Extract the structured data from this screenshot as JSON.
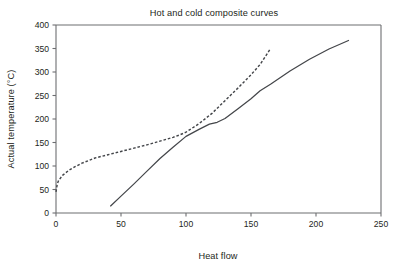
{
  "chart_data": {
    "type": "line",
    "title": "Hot and cold composite curves",
    "xlabel": "Heat flow",
    "ylabel": "Actual temperature (°C)",
    "xlim": [
      0,
      250
    ],
    "ylim": [
      0,
      400
    ],
    "xticks": [
      0,
      50,
      100,
      150,
      200,
      250
    ],
    "yticks": [
      0,
      50,
      100,
      150,
      200,
      250,
      300,
      350,
      400
    ],
    "xtick_labels": [
      "0",
      "50",
      "100",
      "150",
      "200",
      "250"
    ],
    "ytick_labels": [
      "0",
      "50",
      "100",
      "150",
      "200",
      "250",
      "300",
      "350",
      "400"
    ],
    "grid": false,
    "legend": "none",
    "series": [
      {
        "name": "hot composite curve",
        "style": "dashed",
        "color": "#44464a",
        "points": [
          [
            0,
            45
          ],
          [
            1,
            62
          ],
          [
            2,
            69
          ],
          [
            5,
            80
          ],
          [
            10,
            91
          ],
          [
            15,
            99
          ],
          [
            20,
            106
          ],
          [
            30,
            117
          ],
          [
            40,
            124
          ],
          [
            50,
            131
          ],
          [
            60,
            138
          ],
          [
            70,
            145
          ],
          [
            80,
            153
          ],
          [
            90,
            161
          ],
          [
            95,
            166
          ],
          [
            100,
            172
          ],
          [
            110,
            190
          ],
          [
            120,
            212
          ],
          [
            130,
            239
          ],
          [
            140,
            266
          ],
          [
            150,
            294
          ],
          [
            157,
            316
          ],
          [
            162,
            337
          ],
          [
            165,
            350
          ]
        ]
      },
      {
        "name": "cold composite curve",
        "style": "solid",
        "color": "#44464a",
        "points": [
          [
            42,
            15
          ],
          [
            50,
            36
          ],
          [
            60,
            62
          ],
          [
            70,
            89
          ],
          [
            80,
            116
          ],
          [
            90,
            140
          ],
          [
            100,
            163
          ],
          [
            110,
            178
          ],
          [
            118,
            189
          ],
          [
            124,
            193
          ],
          [
            130,
            201
          ],
          [
            140,
            222
          ],
          [
            150,
            243
          ],
          [
            157,
            260
          ],
          [
            165,
            274
          ],
          [
            180,
            302
          ],
          [
            195,
            327
          ],
          [
            210,
            349
          ],
          [
            225,
            367
          ]
        ]
      }
    ]
  },
  "geometry": {
    "plot_left": 56,
    "plot_right": 381,
    "plot_top": 25,
    "plot_bottom": 213,
    "title_x": 214,
    "title_y": 16,
    "xlabel_x": 218,
    "xlabel_y": 259,
    "ylabel_x": 14,
    "ylabel_y": 119
  }
}
